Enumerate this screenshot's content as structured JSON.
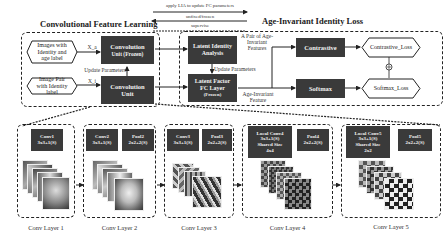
{
  "top": {
    "left_title": "Convolutional Feature Learning",
    "right_title": "Age-Invariant Identity Loss",
    "legend": {
      "apply_lia": "apply LIA to update FC parameters",
      "unfixed_label": "unfixed/frozen",
      "supervise": "supervise"
    }
  },
  "left_panel": {
    "input1": "Images with Identity and age label",
    "input2": "Image Pair with Identity label",
    "x1_label": "X_a",
    "x2_label": "X_i",
    "conv_frozen_line1": "Convolution",
    "conv_frozen_line2": "Unit (Frozen)",
    "update_params": "Update Parameters",
    "conv_line1": "Convolution",
    "conv_line2": "Unit"
  },
  "right_panel": {
    "lia_line1": "Latent Identity",
    "lia_line2": "Analysis",
    "update_params": "Update Parameters",
    "lffc_line1": "Latent Factor",
    "lffc_line2": "FC Layer",
    "lffc_line3": "(Frozen)",
    "pair_label": "A Pair of Age-Invariant Features",
    "feature_label": "Age-Invariant Feature",
    "contrastive": "Contrastive",
    "softmax": "Softmax",
    "contrastive_loss": "Contrastive_Loss",
    "softmax_loss": "Softmax_Loss",
    "combine_symbol": "⊕"
  },
  "layers": [
    {
      "name": "Conv Layer 1",
      "blocks": [
        {
          "l1": "Conv1",
          "l2": "3x3+1(S)"
        }
      ]
    },
    {
      "name": "Conv Layer 2",
      "blocks": [
        {
          "l1": "Conv2",
          "l2": "3x3+1(S)"
        },
        {
          "l1": "Pool2",
          "l2": "2x2+2(S)"
        }
      ]
    },
    {
      "name": "Conv Layer 3",
      "blocks": [
        {
          "l1": "Conv3",
          "l2": "3x3+1(S)"
        },
        {
          "l1": "Pool3",
          "l2": "2x2+2(S)"
        }
      ]
    },
    {
      "name": "Conv Layer 4",
      "blocks": [
        {
          "l1": "Local Conv4",
          "l2": "3x3+1(S)",
          "l3": "Shared Size",
          "l4": "4x4"
        },
        {
          "l1": "Pool4",
          "l2": "2x2+2(S)"
        }
      ]
    },
    {
      "name": "Conv Layer 5",
      "blocks": [
        {
          "l1": "Local Conv5",
          "l2": "3x3+1(S)",
          "l3": "Shared Size",
          "l4": "2x2"
        },
        {
          "l1": "Pool5",
          "l2": "2x2+2(S)"
        }
      ]
    }
  ],
  "colors": {
    "block": "#3a3a3a",
    "block_text": "#f2f2f2",
    "line": "#222222"
  }
}
